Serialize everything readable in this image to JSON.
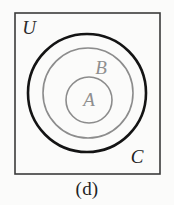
{
  "figure": {
    "caption": "(d)",
    "background_color": "#fbfbfa",
    "universe_rect": {
      "label": "U",
      "label_color": "#2b2b2b",
      "border_color": "#3b3b3b",
      "x": 15,
      "y": 13,
      "width": 145,
      "height": 161
    },
    "sets": [
      {
        "name": "set-c",
        "label": "C",
        "label_color": "#1f1f1f",
        "stroke_color": "#141414",
        "stroke_width": 2.6,
        "cx": 87,
        "cy": 93,
        "r": 59,
        "label_x": 137,
        "label_y": 163
      },
      {
        "name": "set-b",
        "label": "B",
        "label_color": "#8f8f8f",
        "stroke_color": "#8c8c8c",
        "stroke_width": 1.6,
        "cx": 88,
        "cy": 93,
        "r": 45,
        "label_x": 101,
        "label_y": 74
      },
      {
        "name": "set-a",
        "label": "A",
        "label_color": "#8f8f8f",
        "stroke_color": "#8c8c8c",
        "stroke_width": 1.6,
        "cx": 89,
        "cy": 100,
        "r": 23,
        "label_x": 89,
        "label_y": 106
      }
    ],
    "universe_label_x": 29,
    "universe_label_y": 34,
    "label_font_size": 19,
    "set_label_font_size": 19
  }
}
